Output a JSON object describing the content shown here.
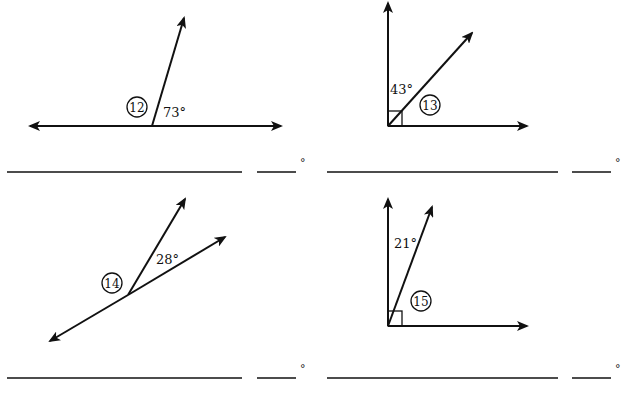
{
  "worksheet": {
    "problems": [
      {
        "number": "12",
        "given_angle": "73°",
        "figure": "straight line with one ray; find supplementary angle",
        "answer_line_name": "",
        "answer_degree_blank": "",
        "degree_symbol": "°"
      },
      {
        "number": "13",
        "given_angle": "43°",
        "figure": "right angle split by a ray; find complementary angle",
        "answer_line_name": "",
        "answer_degree_blank": "",
        "degree_symbol": "°"
      },
      {
        "number": "14",
        "given_angle": "28°",
        "figure": "line with two rays from a point",
        "answer_line_name": "",
        "answer_degree_blank": "",
        "degree_symbol": "°"
      },
      {
        "number": "15",
        "given_angle": "21°",
        "figure": "right angle split by a ray; find complementary angle",
        "answer_line_name": "",
        "answer_degree_blank": "",
        "degree_symbol": "°"
      }
    ]
  },
  "colors": {
    "ink": "#111111",
    "background": "#ffffff"
  }
}
